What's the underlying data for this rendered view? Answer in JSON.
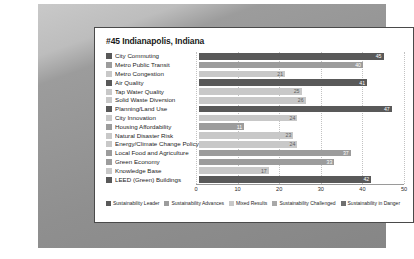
{
  "card": {
    "title": "#45 Indianapolis, Indiana"
  },
  "chart_data": {
    "type": "bar",
    "orientation": "horizontal",
    "title": "#45 Indianapolis, Indiana",
    "xlabel": "",
    "ylabel": "",
    "xlim": [
      0,
      50
    ],
    "xticks": [
      "0",
      "10",
      "20",
      "30",
      "40",
      "50"
    ],
    "grid": true,
    "legend_position": "bottom",
    "categories": [
      "City Commuting",
      "Metro Public Transit",
      "Metro Congestion",
      "Air Quality",
      "Tap Water Quality",
      "Solid Waste Diversion",
      "Planning/Land Use",
      "City Innovation",
      "Housing Affordability",
      "Natural Disaster Risk",
      "Energy/Climate Change Policy",
      "Local Food and Agriculture",
      "Green Economy",
      "Knowledge Base",
      "LEED (Green) Buildings"
    ],
    "values": [
      45,
      40,
      21,
      41,
      25,
      26,
      47,
      24,
      11,
      23,
      24,
      37,
      33,
      17,
      42
    ],
    "bar_classes": [
      "leader",
      "advances",
      "mixed",
      "leader",
      "mixed",
      "mixed",
      "leader",
      "mixed",
      "advances",
      "mixed",
      "mixed",
      "advances",
      "advances",
      "mixed",
      "leader"
    ],
    "colors": {
      "leader": "#595959",
      "advances": "#9c9c9c",
      "mixed": "#c8c8c8",
      "challenged": "#a8a8a8",
      "danger": "#707070"
    }
  },
  "legend": {
    "items": [
      {
        "label": "Sustainability Leader",
        "color": "#595959"
      },
      {
        "label": "Sustainability Advances",
        "color": "#9c9c9c"
      },
      {
        "label": "Mixed Results",
        "color": "#c8c8c8"
      },
      {
        "label": "Sustainability Challenged",
        "color": "#a8a8a8"
      },
      {
        "label": "Sustainability in Danger",
        "color": "#707070"
      }
    ]
  }
}
